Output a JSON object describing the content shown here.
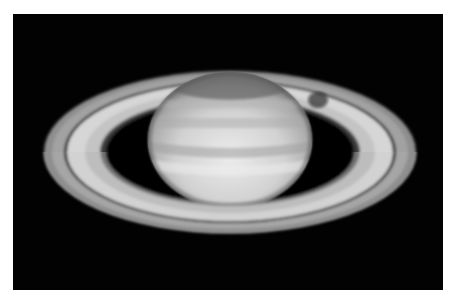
{
  "image": {
    "subject": "Saturn",
    "description": "Grayscale telescope photograph of Saturn with its ring system against a black sky",
    "alt": "Saturn and its rings"
  },
  "colors": {
    "page_background": "#ffffff",
    "sky": "#020202",
    "ring_outer": "#8a8a8a",
    "ring_bright": "#d8d8d8",
    "cassini_division": "#151515",
    "planet_light": "#e6e6e6",
    "planet_dark": "#7a7a7a"
  }
}
